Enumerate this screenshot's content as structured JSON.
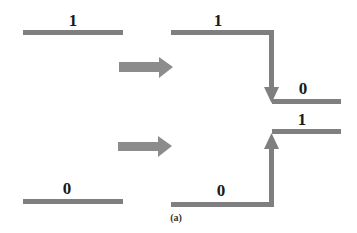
{
  "diagram": {
    "caption": "(a)",
    "colors": {
      "line": "#7f7f7f",
      "arrow": "#8c8c8c",
      "text": "#1a1a1a"
    },
    "input_top": {
      "label": "1"
    },
    "input_bottom": {
      "label": "0"
    },
    "output_top": {
      "label_high": "1",
      "label_low": "0",
      "direction": "falling"
    },
    "output_bottom": {
      "label_low": "0",
      "label_high": "1",
      "direction": "rising"
    },
    "transform_arrows": [
      "right-arrow",
      "right-arrow"
    ]
  }
}
